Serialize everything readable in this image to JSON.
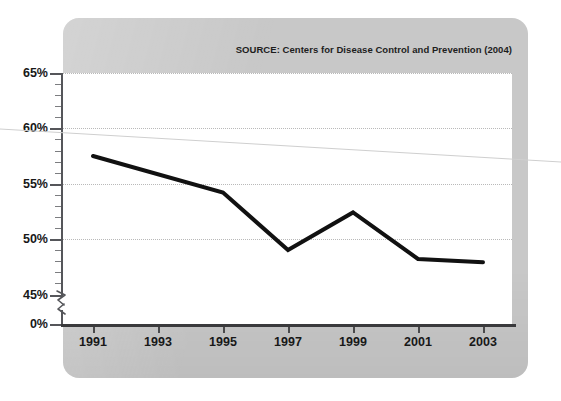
{
  "figure": {
    "source_note": "SOURCE: Centers for Disease Control and Prevention (2004)",
    "panel_color": "#c8c8c8",
    "plot_background": "#ffffff",
    "line_color": "#111111",
    "gridline_color": "#b9b9b9",
    "axis_color": "#3a3a3c"
  },
  "axes": {
    "y_tick_labels": [
      "65%",
      "60%",
      "55%",
      "50%",
      "45%",
      "0%"
    ],
    "x_tick_labels": [
      "1991",
      "1993",
      "1995",
      "1997",
      "1999",
      "2001",
      "2003"
    ],
    "y_axis_break": true,
    "y_axis_break_label": "axis-break"
  },
  "chart_data": {
    "type": "line",
    "title": "",
    "subtitle": "",
    "xlabel": "",
    "ylabel": "",
    "annotations": [
      "SOURCE: Centers for Disease Control and Prevention (2004)"
    ],
    "legend": [],
    "legend_position": "none",
    "grid": true,
    "grid_axis": "y",
    "xlim": [
      1990,
      2004
    ],
    "ylim": [
      45,
      65
    ],
    "y_axis_break": {
      "from": 0,
      "to": 45
    },
    "ytick_values": [
      65,
      60,
      55,
      50,
      45,
      0
    ],
    "ytick_labels": [
      "65%",
      "60%",
      "55%",
      "50%",
      "45%",
      "0%"
    ],
    "xtick_values": [
      1991,
      1993,
      1995,
      1997,
      1999,
      2001,
      2003
    ],
    "xtick_labels": [
      "1991",
      "1993",
      "1995",
      "1997",
      "1999",
      "2001",
      "2003"
    ],
    "x": [
      1991,
      1995,
      1997,
      1999,
      2001,
      2003
    ],
    "values": [
      57.5,
      54.2,
      49.0,
      52.4,
      48.2,
      47.9
    ],
    "series": [
      {
        "name": "",
        "x": [
          1991,
          1995,
          1997,
          1999,
          2001,
          2003
        ],
        "values": [
          57.5,
          54.2,
          49.0,
          52.4,
          48.2,
          47.9
        ],
        "color": "#111111",
        "line_width": 4,
        "markers": false
      }
    ],
    "units": "percent"
  }
}
